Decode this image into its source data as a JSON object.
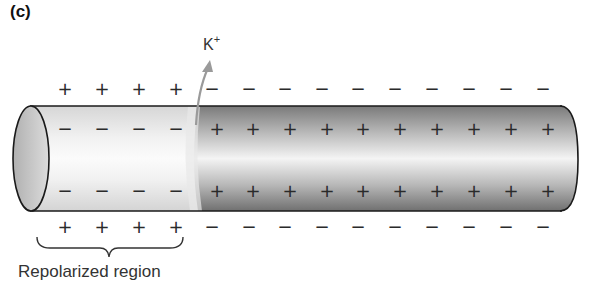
{
  "figure": {
    "panel_label": "(c)",
    "ion": {
      "symbol": "K",
      "charge": "+",
      "direction": "outward (arrow exits axon membrane upward)"
    },
    "region_label": "Repolarized region",
    "region_label_note": "label clipped at bottom edge of image; only upper portion of glyphs visible",
    "rows": {
      "outside_top": [
        "+",
        "+",
        "+",
        "+",
        "−",
        "−",
        "−",
        "−",
        "−",
        "−",
        "−",
        "−",
        "−",
        "−"
      ],
      "inside_top": [
        "−",
        "−",
        "−",
        "−",
        "+",
        "+",
        "+",
        "+",
        "+",
        "+",
        "+",
        "+",
        "+",
        "+"
      ],
      "inside_bottom": [
        "−",
        "−",
        "−",
        "−",
        "+",
        "+",
        "+",
        "+",
        "+",
        "+",
        "+",
        "+",
        "+",
        "+"
      ],
      "outside_bottom": [
        "+",
        "+",
        "+",
        "+",
        "−",
        "−",
        "−",
        "−",
        "−",
        "−",
        "−",
        "−",
        "−",
        "−"
      ]
    },
    "regions": [
      {
        "name": "repolarized",
        "span_charges": 4,
        "shade": "light"
      },
      {
        "name": "depolarized",
        "span_charges": 10,
        "shade": "dark"
      }
    ]
  },
  "colors": {
    "axon_light": "#efefef",
    "axon_dark": "#8a8a8a",
    "outline": "#1a1a1a",
    "arrow": "#9a9a9a",
    "end_cap": "#c8c8c8"
  }
}
